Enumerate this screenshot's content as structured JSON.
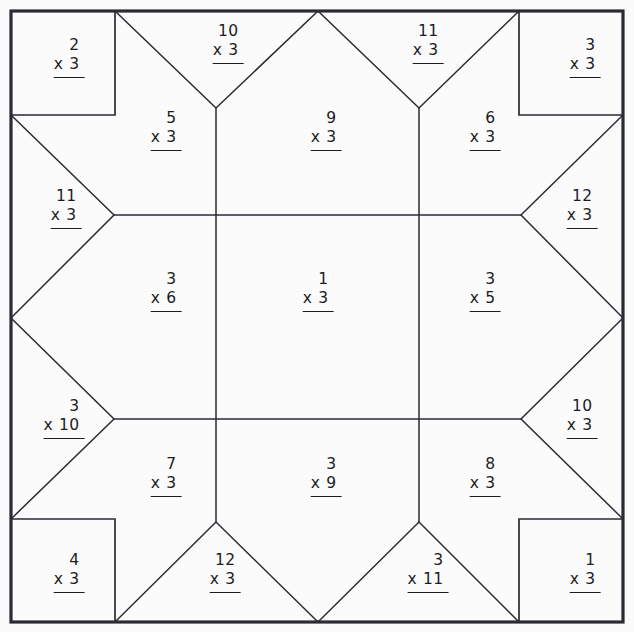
{
  "page": {
    "kind": "multiplication-quilt-star-worksheet",
    "width": 634,
    "height": 632,
    "background_color": "#fbfbfc",
    "line_color": "#2b2b33",
    "text_color": "#1c1c24",
    "operator": "x"
  },
  "problems": [
    {
      "id": "corner-top-left",
      "region": "corner-square",
      "top": "2",
      "op": "x",
      "bottom": "3",
      "x": 69,
      "y": 58
    },
    {
      "id": "top-left-point",
      "region": "edge-triangle",
      "top": "10",
      "op": "x",
      "bottom": "3",
      "x": 228,
      "y": 44
    },
    {
      "id": "top-right-point",
      "region": "edge-triangle",
      "top": "11",
      "op": "x",
      "bottom": "3",
      "x": 428,
      "y": 44
    },
    {
      "id": "corner-top-right",
      "region": "corner-square",
      "top": "3",
      "op": "x",
      "bottom": "3",
      "x": 585,
      "y": 58
    },
    {
      "id": "upper-left-kite",
      "region": "star-kite",
      "top": "5",
      "op": "x",
      "bottom": "3",
      "x": 166,
      "y": 131
    },
    {
      "id": "upper-center-kite",
      "region": "star-kite",
      "top": "9",
      "op": "x",
      "bottom": "3",
      "x": 326,
      "y": 131
    },
    {
      "id": "upper-right-kite",
      "region": "star-kite",
      "top": "6",
      "op": "x",
      "bottom": "3",
      "x": 485,
      "y": 131
    },
    {
      "id": "left-upper-point",
      "region": "edge-triangle",
      "top": "11",
      "op": "x",
      "bottom": "3",
      "x": 66,
      "y": 209
    },
    {
      "id": "right-upper-point",
      "region": "edge-triangle",
      "top": "12",
      "op": "x",
      "bottom": "3",
      "x": 582,
      "y": 209
    },
    {
      "id": "middle-left",
      "region": "inner-square",
      "top": "3",
      "op": "x",
      "bottom": "6",
      "x": 166,
      "y": 292
    },
    {
      "id": "middle-center",
      "region": "inner-square",
      "top": "1",
      "op": "x",
      "bottom": "3",
      "x": 318,
      "y": 292
    },
    {
      "id": "middle-right",
      "region": "inner-square",
      "top": "3",
      "op": "x",
      "bottom": "5",
      "x": 485,
      "y": 292
    },
    {
      "id": "left-lower-point",
      "region": "edge-triangle",
      "top": "3",
      "op": "x",
      "bottom": "10",
      "x": 64,
      "y": 419
    },
    {
      "id": "right-lower-point",
      "region": "edge-triangle",
      "top": "10",
      "op": "x",
      "bottom": "3",
      "x": 582,
      "y": 419
    },
    {
      "id": "lower-left-kite",
      "region": "star-kite",
      "top": "7",
      "op": "x",
      "bottom": "3",
      "x": 166,
      "y": 477
    },
    {
      "id": "lower-center-kite",
      "region": "star-kite",
      "top": "3",
      "op": "x",
      "bottom": "9",
      "x": 326,
      "y": 477
    },
    {
      "id": "lower-right-kite",
      "region": "star-kite",
      "top": "8",
      "op": "x",
      "bottom": "3",
      "x": 485,
      "y": 477
    },
    {
      "id": "corner-bottom-left",
      "region": "corner-square",
      "top": "4",
      "op": "x",
      "bottom": "3",
      "x": 69,
      "y": 573
    },
    {
      "id": "bottom-left-point",
      "region": "edge-triangle",
      "top": "12",
      "op": "x",
      "bottom": "3",
      "x": 225,
      "y": 573
    },
    {
      "id": "bottom-right-point",
      "region": "edge-triangle",
      "top": "3",
      "op": "x",
      "bottom": "11",
      "x": 428,
      "y": 573
    },
    {
      "id": "corner-bottom-right",
      "region": "corner-square",
      "top": "1",
      "op": "x",
      "bottom": "3",
      "x": 585,
      "y": 573
    }
  ],
  "geometry": {
    "outer": {
      "left": 11,
      "top": 11,
      "right": 623,
      "bottom": 622
    },
    "grid_x": [
      216,
      419
    ],
    "grid_y": [
      215,
      419
    ],
    "corner_inset": 104
  }
}
